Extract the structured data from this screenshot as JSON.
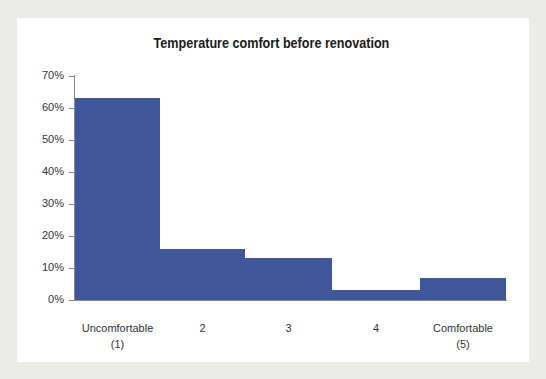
{
  "chart_data": {
    "type": "bar",
    "title": "Temperature comfort before renovation",
    "xlabel": "",
    "ylabel": "",
    "categories": [
      "Uncomfortable\n(1)",
      "2",
      "3",
      "4",
      "Comfortable\n(5)"
    ],
    "values": [
      63,
      16,
      13,
      3,
      7
    ],
    "value_format": "percent",
    "ylim": [
      0,
      70
    ],
    "yticks": [
      "0%",
      "10%",
      "20%",
      "30%",
      "40%",
      "50%",
      "60%",
      "70%"
    ],
    "grid": false,
    "legend": null,
    "bar_gap": 0,
    "bar_color": "#40569a"
  }
}
